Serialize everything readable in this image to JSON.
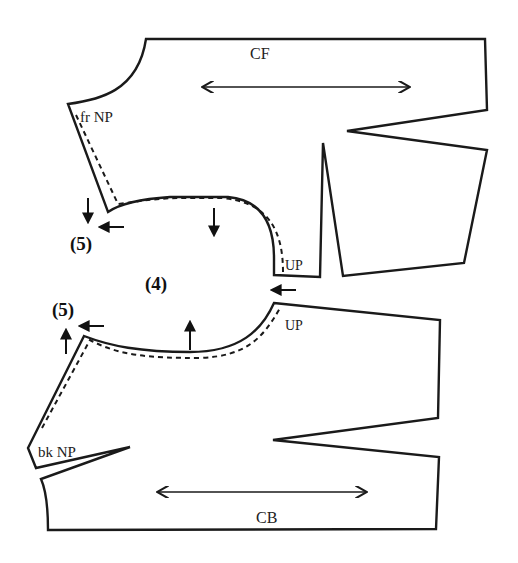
{
  "diagram": {
    "front_piece": {
      "labels": {
        "center": "CF",
        "neck_point": "fr NP",
        "underarm_point": "UP"
      }
    },
    "back_piece": {
      "labels": {
        "center": "CB",
        "neck_point": "bk NP",
        "underarm_point": "UP"
      }
    },
    "step_markers": {
      "armhole": "(4)",
      "front_shoulder": "(5)",
      "back_shoulder": "(5)"
    },
    "colors": {
      "line": "#1a1a1a",
      "background": "#ffffff"
    }
  }
}
